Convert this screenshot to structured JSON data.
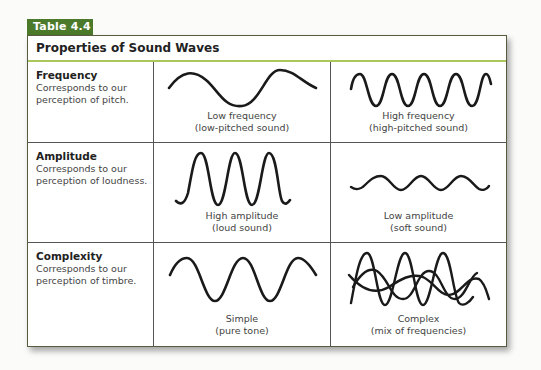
{
  "table_label": "Table 4.4",
  "title": "Properties of Sound Waves",
  "colors": {
    "tab": "#4b7a2b",
    "title_rule": "#a9c75a",
    "wave": "#1a1a1a"
  },
  "rows": [
    {
      "property": "Frequency",
      "description": "Corresponds to our perception of pitch.",
      "examples": [
        {
          "icon": "low-frequency-wave-icon",
          "caption_line1": "Low frequency",
          "caption_line2": "(low-pitched sound)"
        },
        {
          "icon": "high-frequency-wave-icon",
          "caption_line1": "High frequency",
          "caption_line2": "(high-pitched sound)"
        }
      ]
    },
    {
      "property": "Amplitude",
      "description": "Corresponds to our perception of loudness.",
      "examples": [
        {
          "icon": "high-amplitude-wave-icon",
          "caption_line1": "High amplitude",
          "caption_line2": "(loud sound)"
        },
        {
          "icon": "low-amplitude-wave-icon",
          "caption_line1": "Low amplitude",
          "caption_line2": "(soft sound)"
        }
      ]
    },
    {
      "property": "Complexity",
      "description": "Corresponds to our perception of timbre.",
      "examples": [
        {
          "icon": "simple-wave-icon",
          "caption_line1": "Simple",
          "caption_line2": "(pure tone)"
        },
        {
          "icon": "complex-wave-icon",
          "caption_line1": "Complex",
          "caption_line2": "(mix of frequencies)"
        }
      ]
    }
  ]
}
